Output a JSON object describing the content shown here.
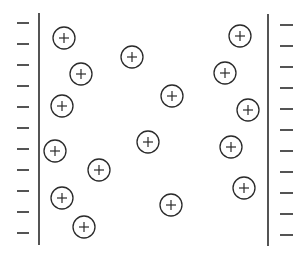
{
  "diagram": {
    "title": "",
    "colors": {
      "line": "#2a2a2a",
      "background": "#ffffff"
    },
    "left_plate": {
      "charge_symbol": "−",
      "charge_count": 11
    },
    "right_plate": {
      "charge_symbol": "−",
      "charge_count": 11
    },
    "ions": {
      "symbol": "+",
      "count": 16
    }
  }
}
